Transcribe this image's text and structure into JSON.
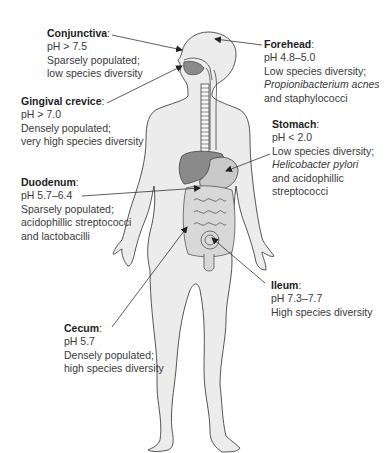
{
  "diagram": {
    "colors": {
      "body_fill": "#ececec",
      "outline": "#444444",
      "organ_fill": "#8a8a8a",
      "gut_fill": "#d8d8d8",
      "arrow": "#333333",
      "text": "#3a3a3a"
    },
    "labels": [
      {
        "id": "conjunctiva",
        "title": "Conjunctiva",
        "ph": "pH > 7.5",
        "lines": [
          "Sparsely populated;",
          "low species diversity"
        ]
      },
      {
        "id": "forehead",
        "title": "Forehead",
        "ph": "pH 4.8–5.0",
        "lines": [
          "Low species diversity;",
          "Propionibacterium acnes",
          "and staphylococci"
        ],
        "italic_line_index": 1
      },
      {
        "id": "gingival-crevice",
        "title": "Gingival crevice",
        "ph": "pH > 7.0",
        "lines": [
          "Densely populated;",
          "very high species diversity"
        ]
      },
      {
        "id": "stomach",
        "title": "Stomach",
        "ph": "pH < 2.0",
        "lines": [
          "Low species diversity;",
          "Helicobacter pylori",
          "and acidophillic",
          "streptococci"
        ],
        "italic_line_index": 1
      },
      {
        "id": "duodenum",
        "title": "Duodenum",
        "ph": "pH 5.7–6.4",
        "lines": [
          "Sparsely populated;",
          "acidophillic streptococci",
          "and lactobacilli"
        ]
      },
      {
        "id": "ileum",
        "title": "Ileum",
        "ph": "pH 7.3–7.7",
        "lines": [
          "High species diversity"
        ]
      },
      {
        "id": "cecum",
        "title": "Cecum",
        "ph": "pH 5.7",
        "lines": [
          "Densely populated;",
          "high species diversity"
        ]
      }
    ],
    "colon": ":"
  }
}
